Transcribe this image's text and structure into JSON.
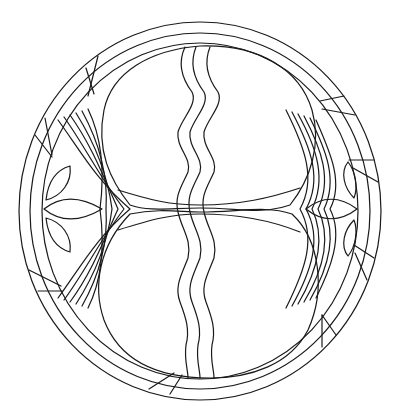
{
  "artwork": {
    "title": "Circular mandala line drawing with two ovals, wavy center stripes and leaf motifs",
    "stroke_color": "#1a1a1a",
    "background_color": "#ffffff",
    "center": [
      200,
      211
    ],
    "outer_ring": {
      "rx_outer": 181,
      "ry_outer": 189,
      "rx_inner": 170,
      "ry_inner": 178,
      "rx_inner2": 158,
      "ry_inner2": 168
    },
    "top_oval": {
      "cx": 214,
      "cy": 122,
      "rx": 116,
      "ry": 82
    },
    "bottom_oval": {
      "cx": 212,
      "cy": 296,
      "rx": 116,
      "ry": 86
    },
    "wavy_lines": 3,
    "chevron_bands": 6,
    "leaf_motifs_per_side": 3,
    "ring_segment_cuts": 8
  }
}
